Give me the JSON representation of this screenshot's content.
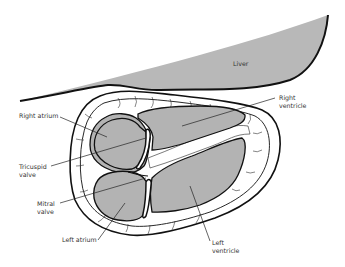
{
  "diagram": {
    "colors": {
      "liver_fill": "#b8b8b8",
      "chamber_fill": "#b3b3b3",
      "outline": "#111111",
      "background": "#ffffff",
      "label_text": "#333333"
    },
    "labels": {
      "liver": "Liver",
      "right_ventricle_line1": "Right",
      "right_ventricle_line2": "ventricle",
      "right_atrium": "Right atrium",
      "tricuspid_valve_line1": "Tricuspid",
      "tricuspid_valve_line2": "valve",
      "mitral_valve_line1": "Mitral",
      "mitral_valve_line2": "valve",
      "left_atrium": "Left atrium",
      "left_ventricle_line1": "Left",
      "left_ventricle_line2": "ventricle"
    }
  }
}
